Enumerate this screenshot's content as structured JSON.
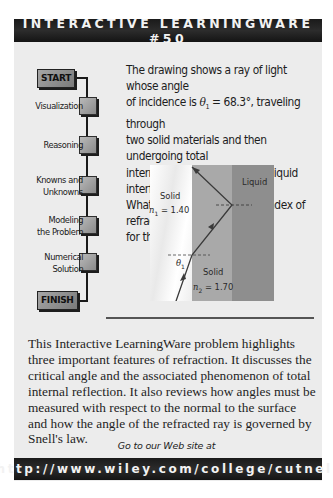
{
  "header": {
    "title": "INTERACTIVE LEARNINGWARE #50"
  },
  "question": {
    "line1": "The drawing shows a ray of light whose angle",
    "line2_pre": "of incidence is ",
    "theta_symbol": "θ",
    "theta_sub": "1",
    "line2_post": " = 68.3°, traveling through",
    "line3": "two solid materials and then undergoing total",
    "line4": "internal reflection at a solid – liquid interface.",
    "line5": "What is the largest possible index of refraction",
    "line6": "for the liquid?",
    "angle_value": "68.3°"
  },
  "flow": {
    "start_label": "START",
    "finish_label": "FINISH",
    "steps": [
      {
        "label_1": "Visualization",
        "label_2": ""
      },
      {
        "label_1": "Reasoning",
        "label_2": ""
      },
      {
        "label_1": "Knowns and",
        "label_2": "Unknowns"
      },
      {
        "label_1": "Modeling",
        "label_2": "the Problem"
      },
      {
        "label_1": "Numerical",
        "label_2": "Solution"
      }
    ]
  },
  "diagram": {
    "solid1_label": "Solid",
    "solid1_index_symbol": "n",
    "solid1_index_sub": "1",
    "solid1_index_value": " = 1.40",
    "solid2_label": "Solid",
    "solid2_index_symbol": "n",
    "solid2_index_sub": "2",
    "solid2_index_value": " = 1.70",
    "liquid_label": "Liquid",
    "angle_symbol": "θ",
    "angle_sub": "1",
    "colors": {
      "solid1": "#f4f4f4",
      "solid2": "#a9a9a9",
      "liquid": "#8e8e8e",
      "ray": "#3a3a3a"
    }
  },
  "description": {
    "text": "This Interactive LearningWare problem highlights three important features of refraction. It discusses the critical angle and the associated phenomenon of total internal reflection. It also reviews how angles must be measured with respect to the normal to the surface and how the angle of the refracted ray is governed by Snell's law."
  },
  "footer": {
    "goto_text": "Go to our Web site at",
    "url": "http://www.wiley.com/college/cutnell"
  }
}
